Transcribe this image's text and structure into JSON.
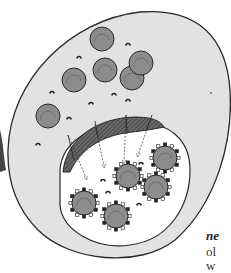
{
  "diagram": {
    "colors": {
      "cytoplasm": "#e2e2e2",
      "outline": "#2a2a2a",
      "vacuole": "#ffffff",
      "granule": "#8c8c8c",
      "granule_ring": "#6e6e6e",
      "cap": "#555555",
      "hatched_fusion": "#5a5a5a",
      "shadow": "#444444"
    },
    "cytoplasm_granules": [
      {
        "cx": 102,
        "cy": 39,
        "r": 12
      },
      {
        "cx": 105,
        "cy": 70,
        "r": 12
      },
      {
        "cx": 74,
        "cy": 80,
        "r": 12
      },
      {
        "cx": 132,
        "cy": 78,
        "r": 12
      },
      {
        "cx": 141,
        "cy": 63,
        "r": 12
      },
      {
        "cx": 48,
        "cy": 116,
        "r": 12
      }
    ],
    "studded_particles": [
      {
        "cx": 165,
        "cy": 158,
        "r": 12
      },
      {
        "cx": 128,
        "cy": 176,
        "r": 12
      },
      {
        "cx": 156,
        "cy": 187,
        "r": 12
      },
      {
        "cx": 84,
        "cy": 203,
        "r": 12
      },
      {
        "cx": 116,
        "cy": 216,
        "r": 12
      }
    ],
    "small_caps": [
      {
        "x": 128,
        "y": 44
      },
      {
        "x": 79,
        "y": 57
      },
      {
        "x": 52,
        "y": 92
      },
      {
        "x": 91,
        "y": 103
      },
      {
        "x": 114,
        "y": 94
      },
      {
        "x": 128,
        "y": 100
      },
      {
        "x": 69,
        "y": 118
      },
      {
        "x": 38,
        "y": 144
      },
      {
        "x": 103,
        "y": 180
      },
      {
        "x": 108,
        "y": 192
      },
      {
        "x": 141,
        "y": 163
      },
      {
        "x": 139,
        "y": 204
      }
    ],
    "arrows": [
      {
        "x1": 68,
        "y1": 135,
        "x2": 86,
        "y2": 178
      },
      {
        "x1": 95,
        "y1": 124,
        "x2": 104,
        "y2": 166
      },
      {
        "x1": 126,
        "y1": 115,
        "x2": 124,
        "y2": 162
      },
      {
        "x1": 152,
        "y1": 115,
        "x2": 138,
        "y2": 155
      }
    ]
  },
  "caption_fragments": {
    "line1": "ne",
    "line2": "ol",
    "line3": "w"
  }
}
